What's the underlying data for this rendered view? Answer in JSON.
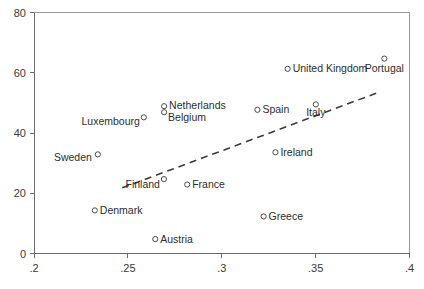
{
  "chart_data": {
    "type": "scatter",
    "title": "",
    "subtitle": "",
    "xlabel": "",
    "ylabel": "",
    "xlim": [
      0.2,
      0.4
    ],
    "ylim": [
      0,
      80
    ],
    "xticks": [
      ".2",
      ".25",
      ".3",
      ".35",
      ".4"
    ],
    "xtick_values": [
      0.2,
      0.25,
      0.3,
      0.35,
      0.4
    ],
    "yticks": [
      "0",
      "20",
      "40",
      "60",
      "80"
    ],
    "ytick_values": [
      0,
      20,
      40,
      60,
      80
    ],
    "grid": false,
    "legend": "none",
    "marker_style": "open-circle",
    "points": [
      {
        "label": "Sweden",
        "x": 0.234,
        "y": 32.9,
        "label_pos": "left",
        "label_dx": -6,
        "label_dy": 7
      },
      {
        "label": "Denmark",
        "x": 0.2324,
        "y": 14.3,
        "label_pos": "right",
        "label_dx": 5,
        "label_dy": 3.5
      },
      {
        "label": "Luxembourg",
        "x": 0.2585,
        "y": 45.2,
        "label_pos": "left",
        "label_dx": -4,
        "label_dy": 8
      },
      {
        "label": "Belgium",
        "x": 0.2693,
        "y": 46.9,
        "label_pos": "right",
        "label_dx": 4,
        "label_dy": 8.5
      },
      {
        "label": "Netherlands",
        "x": 0.2693,
        "y": 48.9,
        "label_pos": "right",
        "label_dx": 5,
        "label_dy": 3
      },
      {
        "label": "Austria",
        "x": 0.2646,
        "y": 4.8,
        "label_pos": "right",
        "label_dx": 5,
        "label_dy": 3.5
      },
      {
        "label": "Finland",
        "x": 0.2692,
        "y": 24.7,
        "label_pos": "left",
        "label_dx": -4,
        "label_dy": 9
      },
      {
        "label": "France",
        "x": 0.2816,
        "y": 22.9,
        "label_pos": "right",
        "label_dx": 5,
        "label_dy": 3.5
      },
      {
        "label": "Spain",
        "x": 0.319,
        "y": 47.7,
        "label_pos": "right",
        "label_dx": 5,
        "label_dy": 3.5
      },
      {
        "label": "Greece",
        "x": 0.3223,
        "y": 12.3,
        "label_pos": "right",
        "label_dx": 5,
        "label_dy": 3.5
      },
      {
        "label": "Ireland",
        "x": 0.3286,
        "y": 33.6,
        "label_pos": "right",
        "label_dx": 5,
        "label_dy": 3.5
      },
      {
        "label": "United Kingdom",
        "x": 0.3351,
        "y": 61.3,
        "label_pos": "right",
        "label_dx": 5,
        "label_dy": 3.5
      },
      {
        "label": "Italy",
        "x": 0.3501,
        "y": 49.5,
        "label_pos": "mid",
        "label_dx": 0,
        "label_dy": 12
      },
      {
        "label": "Portugal",
        "x": 0.3866,
        "y": 64.7,
        "label_pos": "mid",
        "label_dx": 0,
        "label_dy": 13
      }
    ],
    "fit_line": {
      "style": "dashed",
      "x0": 0.247,
      "y0": 21.8,
      "x1": 0.384,
      "y1": 53.6
    }
  }
}
